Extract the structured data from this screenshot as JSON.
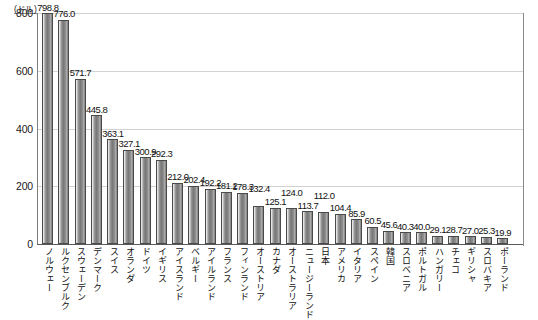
{
  "chart_data": {
    "type": "bar",
    "title": "",
    "subtitle": "",
    "xlabel": "",
    "ylabel": "",
    "unit_label": "(ドル)",
    "ylim": [
      0,
      800
    ],
    "yticks": [
      0,
      200,
      400,
      600,
      800
    ],
    "ytick_labels": [
      "0",
      "200",
      "400",
      "600",
      "800"
    ],
    "grid": true,
    "legend": null,
    "orientation": "vertical",
    "categories": [
      "ノルウェー",
      "ルクセンブルク",
      "スウェーデン",
      "デンマーク",
      "スイス",
      "オランダ",
      "ドイツ",
      "イギリス",
      "アイスランド",
      "ベルギー",
      "アイルランド",
      "フランス",
      "フィンランド",
      "オーストリア",
      "カナダ",
      "オーストラリア",
      "ニュージーランド",
      "日本",
      "アメリカ",
      "イタリア",
      "スペイン",
      "韓国",
      "スロベニア",
      "ポルトガル",
      "ハンガリー",
      "チェコ",
      "ギリシャ",
      "スロバキア",
      "ポーランド"
    ],
    "values": [
      798.8,
      776.0,
      571.7,
      445.8,
      363.1,
      327.1,
      300.9,
      292.3,
      212.0,
      202.4,
      192.2,
      181.2,
      178.3,
      132.4,
      125.1,
      124.0,
      113.7,
      112.0,
      104.4,
      85.9,
      60.5,
      45.6,
      40.3,
      40.0,
      29.1,
      28.7,
      27.0,
      25.3,
      19.9
    ],
    "value_labels": [
      "798.8",
      "776.0",
      "571.7",
      "445.8",
      "363.1",
      "327.1",
      "300.9",
      "292.3",
      "212.0",
      "202.4",
      "192.2",
      "181.2",
      "178.3",
      "132.4",
      "125.1",
      "124.0",
      "113.7",
      "112.0",
      "104.4",
      "85.9",
      "60.5",
      "45.6",
      "40.3",
      "40.0",
      "29.1",
      "28.7",
      "27.0",
      "25.3",
      "19.9"
    ],
    "colors": {
      "bar_fill": "#808080",
      "bar_edge": "#4a4a4a",
      "grid": "#d2d2d2",
      "axis": "#5a5a5a",
      "text": "#111111",
      "background": "#ffffff"
    }
  }
}
